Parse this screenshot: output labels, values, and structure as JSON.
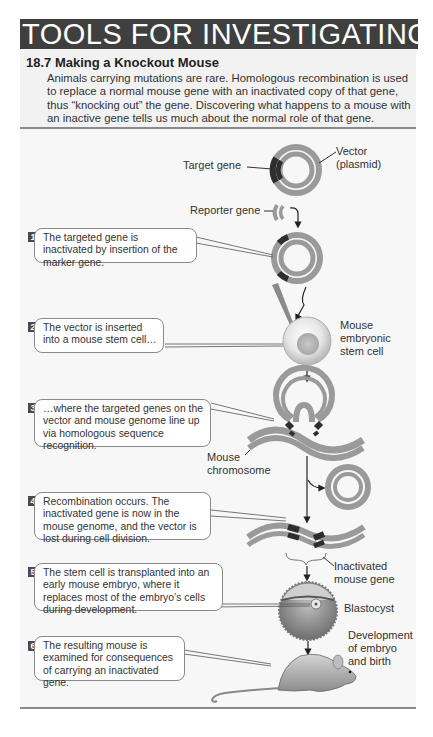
{
  "header": {
    "banner_title": "TOOLS FOR INVESTIGATING LIFE"
  },
  "figure": {
    "number": "18.7",
    "title": "18.7  Making a Knockout Mouse",
    "description": "Animals carrying mutations are rare. Homologous recombination is used to replace a normal mouse gene with an inactivated copy of that gene, thus “knocking out” the gene. Discovering what happens to a mouse with an inactive gene tells us much about the normal role of that gene."
  },
  "labels": {
    "target_gene": "Target gene",
    "vector_line1": "Vector",
    "vector_line2": "(plasmid)",
    "reporter_gene": "Reporter gene",
    "stem_cell_line1": "Mouse",
    "stem_cell_line2": "embryonic",
    "stem_cell_line3": "stem cell",
    "chromosome_line1": "Mouse",
    "chromosome_line2": "chromosome",
    "inactivated_line1": "Inactivated",
    "inactivated_line2": "mouse gene",
    "blastocyst": "Blastocyst",
    "development_line1": "Development",
    "development_line2": "of embryo",
    "development_line3": "and birth"
  },
  "steps": [
    {
      "number": "1",
      "text": "The targeted gene is inactivated by insertion of the marker gene."
    },
    {
      "number": "2",
      "text": "The vector is inserted into a mouse stem cell…"
    },
    {
      "number": "3",
      "text": "…where the targeted genes on the vector and mouse genome line up via homologous sequence recognition."
    },
    {
      "number": "4",
      "text": "Recombination occurs. The inactivated gene is now in the mouse genome, and the vector is lost during cell division."
    },
    {
      "number": "5",
      "text": "The stem cell is transplanted into an early mouse embryo, where it replaces most of the embryo’s cells during development."
    },
    {
      "number": "6",
      "text": "The resulting mouse is examined for consequences of carrying an inactivated gene."
    }
  ],
  "colors": {
    "banner": "#3f3f3f",
    "intro_panel": "#f2f2f2",
    "dna_gray": "#9a9a9a",
    "gene_dark": "#2e2e2e",
    "figure_bg": "#f7f7f7"
  }
}
